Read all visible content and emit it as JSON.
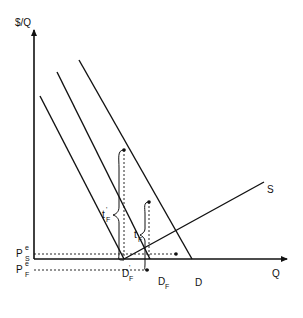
{
  "diagram": {
    "type": "supply-demand",
    "axes": {
      "y_label": "$/Q",
      "x_label": "Q"
    },
    "curves": [
      {
        "id": "D_F_prime",
        "label": "D",
        "subscript": "F",
        "prime": "'"
      },
      {
        "id": "D_F",
        "label": "D",
        "subscript": "F"
      },
      {
        "id": "D",
        "label": "D"
      },
      {
        "id": "S",
        "label": "S"
      }
    ],
    "price_levels": [
      {
        "id": "P_S",
        "label": "P",
        "superscript": "e",
        "subscript": "S"
      },
      {
        "id": "P_F",
        "label": "P",
        "superscript": "e",
        "subscript": "F"
      }
    ],
    "wedges": [
      {
        "id": "t_F_prime",
        "label": "t",
        "subscript": "F",
        "prime": "'"
      },
      {
        "id": "t_F",
        "label": "t",
        "subscript": "F"
      }
    ],
    "colors": {
      "line": "#111111",
      "background": "#ffffff"
    }
  }
}
